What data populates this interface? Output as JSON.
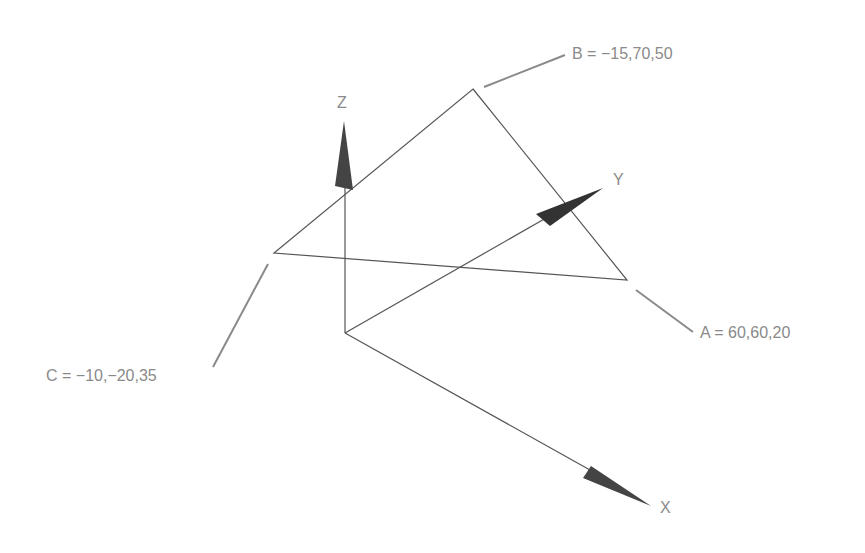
{
  "diagram": {
    "type": "3d-triangle-in-coordinate-system",
    "axes": [
      {
        "name": "X",
        "label": "X"
      },
      {
        "name": "Y",
        "label": "Y"
      },
      {
        "name": "Z",
        "label": "Z"
      }
    ],
    "points": [
      {
        "name": "A",
        "label": "A = 60,60,20",
        "coords": [
          60,
          60,
          20
        ]
      },
      {
        "name": "B",
        "label": "B = −15,70,50",
        "coords": [
          -15,
          70,
          50
        ]
      },
      {
        "name": "C",
        "label": "C = −10,−20,35",
        "coords": [
          -10,
          -20,
          35
        ]
      }
    ],
    "colors": {
      "line": "#555555",
      "leader": "#8a8a8a",
      "arrow": "#3a3a3a",
      "text": "#8a8a8a"
    }
  }
}
